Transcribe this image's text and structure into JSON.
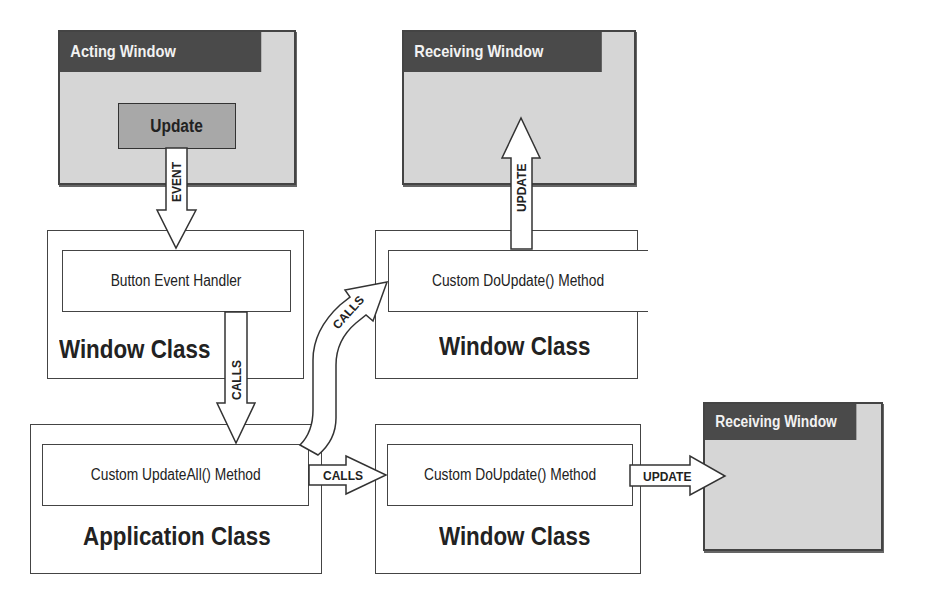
{
  "diagram": {
    "acting_window": {
      "title": "Acting Window",
      "button_label": "Update"
    },
    "top_right_window": {
      "title": "Receiving Window"
    },
    "bottom_right_window": {
      "title": "Receiving Window"
    },
    "left_window_class": {
      "method": "Button Event Handler",
      "label": "Window Class"
    },
    "application_class": {
      "method": "Custom UpdateAll() Method",
      "label": "Application Class"
    },
    "top_window_class": {
      "method": "Custom DoUpdate() Method",
      "label": "Window Class"
    },
    "bottom_window_class": {
      "method": "Custom DoUpdate() Method",
      "label": "Window Class"
    },
    "arrows": {
      "event": "EVENT",
      "calls_down": "CALLS",
      "calls_curved": "CALLS",
      "calls_right": "CALLS",
      "update_up": "UPDATE",
      "update_right": "UPDATE"
    },
    "colors": {
      "window_title_bg": "#4a4a4a",
      "window_body_bg": "#d6d6d6",
      "button_bg": "#a8a8a8",
      "outline": "#444444"
    }
  }
}
